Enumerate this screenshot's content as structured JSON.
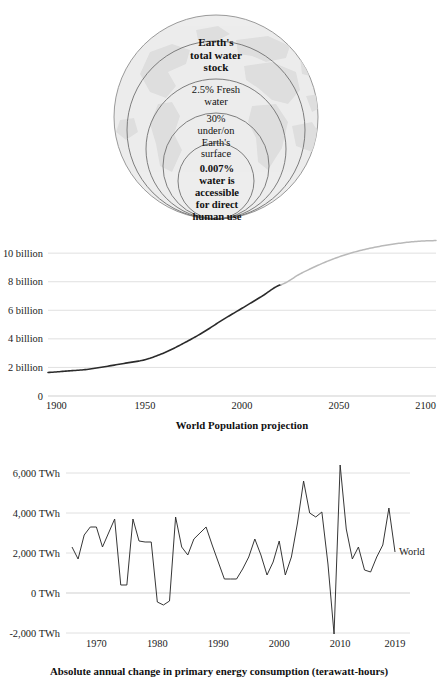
{
  "figure": {
    "panels": [
      "water-stock-globe",
      "world-population-projection",
      "annual-energy-change"
    ]
  },
  "globe": {
    "name": "earth-water-stock-diagram",
    "rings": [
      {
        "id": "total",
        "label": "Earth's\ntotal water\nstock",
        "bold": true
      },
      {
        "id": "fresh",
        "label": "2.5% Fresh\nwater",
        "bold": false
      },
      {
        "id": "surface",
        "label": "30%\nunder/on\nEarth's\nsurface",
        "bold": false
      },
      {
        "id": "accessible",
        "label": "0.007%\nwater is\naccessible\nfor direct\nhuman use",
        "bold": true
      }
    ],
    "label_total": "Earth's total water stock",
    "label_total_lines": [
      "Earth's",
      "total water",
      "stock"
    ],
    "label_fresh_lines": [
      "2.5% Fresh",
      "water"
    ],
    "label_surface_lines": [
      "30%",
      "under/on",
      "Earth's",
      "surface"
    ],
    "label_accessible_lines": [
      "0.007%",
      "water is",
      "accessible",
      "for direct",
      "human use"
    ],
    "colors": {
      "sphere": "#ececec",
      "land": "#dcdcdc",
      "ring_stroke": "#6e6e6e"
    }
  },
  "chart_data": [
    {
      "id": "world-population-projection",
      "type": "line",
      "title": "World Population projection",
      "xlabel": "",
      "ylabel": "",
      "xlim": [
        1900,
        2100
      ],
      "ylim": [
        0,
        11.2
      ],
      "grid": true,
      "legend": "none",
      "xticks": [
        "1900",
        "1950",
        "2000",
        "2050",
        "2100"
      ],
      "xtick_values": [
        1900,
        1950,
        2000,
        2050,
        2100
      ],
      "yticks": [
        "0",
        "2 billion",
        "4 billion",
        "6 billion",
        "8 billion",
        "10 billion"
      ],
      "ytick_values": [
        0,
        2,
        4,
        6,
        8,
        10
      ],
      "series": [
        {
          "name": "historical",
          "color": "#2b2b2b",
          "x": [
            1900,
            1910,
            1920,
            1930,
            1940,
            1950,
            1960,
            1970,
            1980,
            1990,
            2000,
            2010,
            2020
          ],
          "values": [
            1.65,
            1.75,
            1.86,
            2.07,
            2.3,
            2.54,
            3.03,
            3.7,
            4.46,
            5.33,
            6.14,
            6.96,
            7.79
          ]
        },
        {
          "name": "projection",
          "color": "#b9b9b9",
          "x": [
            2020,
            2030,
            2040,
            2050,
            2060,
            2070,
            2080,
            2090,
            2100
          ],
          "values": [
            7.79,
            8.55,
            9.2,
            9.74,
            10.15,
            10.45,
            10.67,
            10.82,
            10.88
          ]
        }
      ]
    },
    {
      "id": "annual-energy-change",
      "type": "line",
      "title": "Absolute annual change in primary energy consumption (terawatt-hours)",
      "xlabel": "",
      "ylabel": "",
      "xlim": [
        1966,
        2019
      ],
      "ylim": [
        -2000,
        6800
      ],
      "grid": true,
      "legend": "right-inline",
      "legend_label": "World",
      "xticks": [
        "1970",
        "1980",
        "1990",
        "2000",
        "2010",
        "2019"
      ],
      "xtick_values": [
        1970,
        1980,
        1990,
        2000,
        2010,
        2019
      ],
      "yticks": [
        "-2,000 TWh",
        "0 TWh",
        "2,000 TWh",
        "4,000 TWh",
        "6,000 TWh"
      ],
      "ytick_values": [
        -2000,
        0,
        2000,
        4000,
        6000
      ],
      "series": [
        {
          "name": "World",
          "color": "#2b2b2b",
          "x": [
            1966,
            1967,
            1968,
            1969,
            1970,
            1971,
            1972,
            1973,
            1974,
            1975,
            1976,
            1977,
            1978,
            1979,
            1980,
            1981,
            1982,
            1983,
            1984,
            1985,
            1986,
            1987,
            1988,
            1989,
            1990,
            1991,
            1992,
            1993,
            1994,
            1995,
            1996,
            1997,
            1998,
            1999,
            2000,
            2001,
            2002,
            2003,
            2004,
            2005,
            2006,
            2007,
            2008,
            2009,
            2010,
            2011,
            2012,
            2013,
            2014,
            2015,
            2016,
            2017,
            2018,
            2019
          ],
          "values": [
            2300,
            1700,
            2900,
            3300,
            3300,
            2300,
            3000,
            3700,
            400,
            400,
            3700,
            2600,
            2550,
            2550,
            -450,
            -600,
            -400,
            3800,
            2300,
            1900,
            2700,
            3000,
            3300,
            2400,
            1550,
            700,
            700,
            700,
            1200,
            1800,
            2700,
            1900,
            900,
            1550,
            2600,
            900,
            1800,
            3500,
            5600,
            4000,
            3800,
            4050,
            1450,
            -2050,
            6400,
            3200,
            1700,
            2300,
            1150,
            1050,
            1800,
            2400,
            4250,
            2050
          ]
        }
      ]
    }
  ]
}
